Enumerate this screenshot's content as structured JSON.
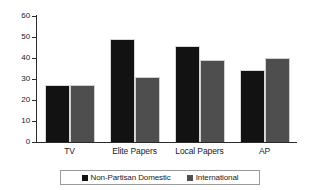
{
  "chart_data": {
    "type": "bar",
    "title": "",
    "xlabel": "",
    "ylabel": "",
    "categories": [
      "TV",
      "Elite Papers",
      "Local Papers",
      "AP"
    ],
    "series": [
      {
        "name": "Non-Partisan Domestic",
        "color": "#121212",
        "values": [
          27,
          49,
          45.5,
          34.5
        ]
      },
      {
        "name": "International",
        "color": "#4e4e4e",
        "values": [
          27,
          31,
          39,
          40
        ]
      }
    ],
    "ylim": [
      0,
      60
    ],
    "yticks": [
      0,
      10,
      20,
      30,
      40,
      50,
      60
    ],
    "ytick_labels": [
      "0",
      "10",
      "20",
      "30",
      "40",
      "50",
      "60"
    ],
    "grid": false,
    "legend_position": "bottom"
  }
}
